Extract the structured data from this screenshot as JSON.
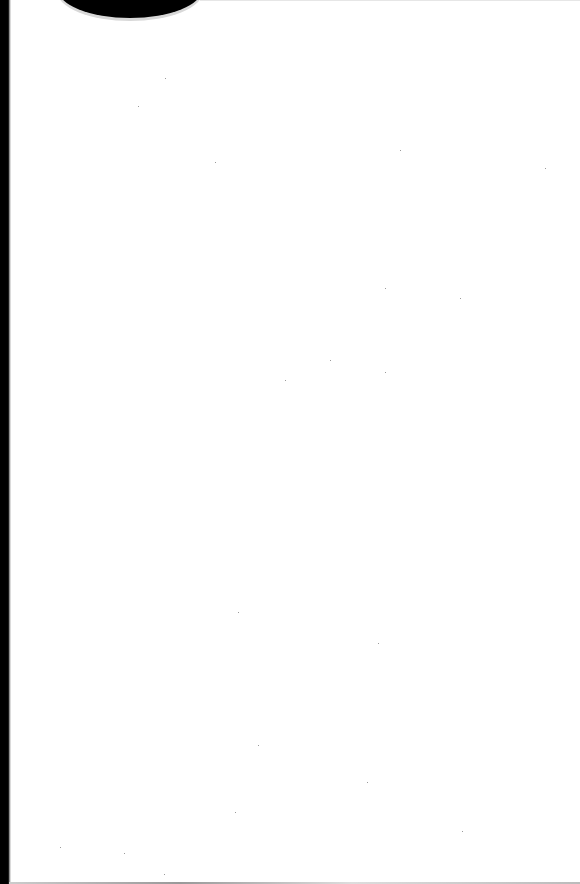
{
  "page": {
    "type": "scanned blank page",
    "content": ""
  }
}
